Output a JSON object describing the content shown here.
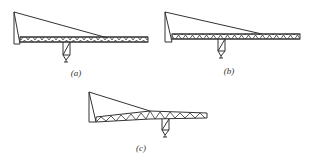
{
  "figure": {
    "panels": [
      {
        "id": "a",
        "label": "(a)"
      },
      {
        "id": "b",
        "label": "(b)"
      },
      {
        "id": "c",
        "label": "(c)"
      }
    ],
    "colors": {
      "line": "#333333",
      "background": "#ffffff"
    }
  }
}
